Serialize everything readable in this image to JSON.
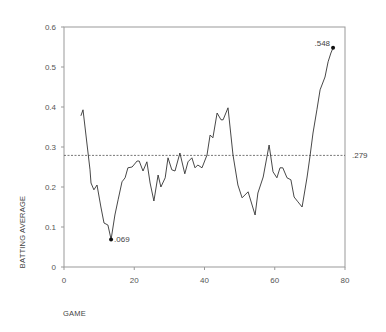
{
  "chart_data": {
    "type": "line",
    "title": "",
    "xlabel": "GAME",
    "ylabel": "BATTING AVERAGE",
    "xlim": [
      0,
      80
    ],
    "ylim": [
      0,
      0.6
    ],
    "x_ticks": [
      0,
      20,
      40,
      60,
      80
    ],
    "x_tick_labels": [
      "0",
      "20",
      "40",
      "60",
      "80"
    ],
    "y_ticks": [
      0,
      0.1,
      0.2,
      0.3,
      0.4,
      0.5,
      0.6
    ],
    "y_tick_labels": [
      "0",
      "0.1",
      "0.2",
      "0.3",
      "0.4",
      "0.5",
      "0.6"
    ],
    "grid": false,
    "legend": null,
    "series": [
      {
        "name": "Batting average",
        "x": [
          4.8,
          5.4,
          7.4,
          7.7,
          8.5,
          9.4,
          10.5,
          11.4,
          12.5,
          13.4,
          14.5,
          15.4,
          16.5,
          17.4,
          18.2,
          19.4,
          20.8,
          21.4,
          22.5,
          23.6,
          24.5,
          25.6,
          26.8,
          27.6,
          28.8,
          29.6,
          30.7,
          31.6,
          33.0,
          34.4,
          35.3,
          36.4,
          37.3,
          38.1,
          39.3,
          40.7,
          41.6,
          42.4,
          43.6,
          44.7,
          45.3,
          46.7,
          48.1,
          49.5,
          50.7,
          52.4,
          54.4,
          55.2,
          56.7,
          58.4,
          59.5,
          60.6,
          61.5,
          62.3,
          63.5,
          64.6,
          65.5,
          66.6,
          67.8,
          69.2,
          70.0,
          70.9,
          72.0,
          72.9,
          74.3,
          75.2,
          76.0,
          76.6
        ],
        "y": [
          0.378,
          0.393,
          0.243,
          0.21,
          0.193,
          0.205,
          0.15,
          0.11,
          0.105,
          0.069,
          0.13,
          0.168,
          0.213,
          0.223,
          0.248,
          0.25,
          0.265,
          0.265,
          0.24,
          0.263,
          0.21,
          0.165,
          0.23,
          0.2,
          0.223,
          0.273,
          0.243,
          0.24,
          0.285,
          0.233,
          0.263,
          0.273,
          0.248,
          0.255,
          0.248,
          0.28,
          0.33,
          0.323,
          0.385,
          0.368,
          0.368,
          0.398,
          0.28,
          0.205,
          0.173,
          0.188,
          0.13,
          0.185,
          0.225,
          0.305,
          0.238,
          0.223,
          0.248,
          0.248,
          0.223,
          0.218,
          0.175,
          0.163,
          0.15,
          0.225,
          0.275,
          0.335,
          0.393,
          0.443,
          0.475,
          0.513,
          0.535,
          0.548
        ],
        "color": "#333333"
      }
    ],
    "reference_line": {
      "y": 0.279,
      "label": ".279",
      "style": "dotted"
    },
    "annotations": [
      {
        "x": 13.4,
        "y": 0.069,
        "label": ".069",
        "marker": "dot"
      },
      {
        "x": 76.6,
        "y": 0.548,
        "label": ".548",
        "marker": "dot"
      }
    ]
  },
  "layout": {
    "plot": {
      "left": 64,
      "right": 345,
      "top": 27,
      "bottom": 267
    },
    "colors": {
      "line": "#333333",
      "axis": "#999999",
      "text": "#555555",
      "ref": "#555555"
    }
  }
}
